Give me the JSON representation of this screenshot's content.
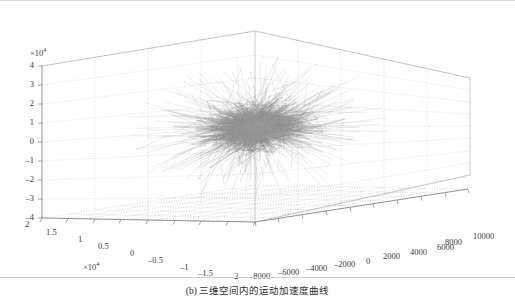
{
  "figure": {
    "caption": "(b) 三维空间内的运动加速度曲线",
    "background_color": "#ffffff",
    "grid_color": "#b9b9b9",
    "axis_color": "#7d7d7d",
    "data_color": "#8f8f8f"
  },
  "axes": {
    "z": {
      "exponent_label": "×10",
      "exponent_power": "4",
      "ticks": [
        "4",
        "3",
        "2",
        "1",
        "0",
        "–1",
        "–2",
        "–3",
        "–4"
      ],
      "values": [
        40000,
        30000,
        20000,
        10000,
        0,
        -10000,
        -20000,
        -30000,
        -40000
      ]
    },
    "x": {
      "exponent_label": "×10",
      "exponent_power": "4",
      "ticks": [
        "2",
        "1.5",
        "1",
        "0.5",
        "0",
        "–0.5",
        "–1",
        "–1.5",
        "–2"
      ],
      "values": [
        20000,
        15000,
        10000,
        5000,
        0,
        -5000,
        -10000,
        -15000,
        -20000
      ]
    },
    "y": {
      "ticks": [
        "–8000",
        "–6000",
        "–4000",
        "–2000",
        "0",
        "2000",
        "4000",
        "6000",
        "8000",
        "10000"
      ],
      "values": [
        -8000,
        -6000,
        -4000,
        -2000,
        0,
        2000,
        4000,
        6000,
        8000,
        10000
      ]
    }
  },
  "chart_data": {
    "type": "line",
    "subtype": "3d-trajectory-scatter",
    "title": "",
    "subtitle": "",
    "caption": "(b) 三维空间内的运动加速度曲线",
    "xlabel": "",
    "ylabel": "",
    "zlabel": "",
    "xlim": [
      -20000,
      20000
    ],
    "ylim": [
      -8000,
      10000
    ],
    "zlim": [
      -40000,
      40000
    ],
    "x_tick_labels": [
      "2",
      "1.5",
      "1",
      "0.5",
      "0",
      "–0.5",
      "–1",
      "–1.5",
      "–2"
    ],
    "y_tick_labels": [
      "–8000",
      "–6000",
      "–4000",
      "–2000",
      "0",
      "2000",
      "4000",
      "6000",
      "8000",
      "10000"
    ],
    "z_tick_labels": [
      "4",
      "3",
      "2",
      "1",
      "0",
      "–1",
      "–2",
      "–3",
      "–4"
    ],
    "x_exponent": "×10^4",
    "z_exponent": "×10^4",
    "grid": true,
    "legend": null,
    "series": [
      {
        "name": "acceleration trajectory",
        "color": "#8f8f8f",
        "description": "Dense radial star-burst of connected acceleration samples centred near the origin, with long spikes radiating outward in all directions.",
        "center": [
          0,
          1000,
          0
        ],
        "n_points": 2000,
        "radial_spread_sigma": [
          3000,
          1400,
          6000
        ],
        "spike_fraction": 0.22,
        "spike_max_radius": [
          18000,
          8000,
          38000
        ]
      }
    ]
  }
}
